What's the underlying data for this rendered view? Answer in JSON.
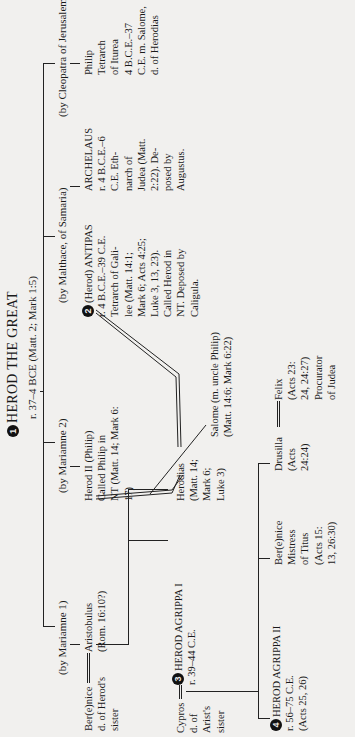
{
  "root": {
    "number": "1",
    "name": "HEROD THE GREAT",
    "reign": "r. 37–4 BCE (Matt. 2; Mark 1:5)"
  },
  "wives": [
    {
      "label": "(by Mariamne 1)"
    },
    {
      "label": "(by Mariamne 2)"
    },
    {
      "label": "(by Malthace, of Samaria)"
    },
    {
      "label": "(by Cleopatra of Jerusalem)"
    }
  ],
  "people": {
    "berenice_sister": {
      "lines": [
        "Ber(e)nice",
        "d. of Herod's",
        "sister"
      ]
    },
    "aristobulus": {
      "lines": [
        "Aristobulus",
        "(Rom. 16:10?)"
      ]
    },
    "herod_ii": {
      "lines": [
        "Herod II (Philip)",
        "Called Philip in",
        "NT (Matt. 14; Mark 6:",
        "17)"
      ]
    },
    "antipas": {
      "number": "2",
      "lines": [
        "(Herod) ANTIPAS",
        "r. 4 B.C.E.–39 C.E.",
        "Tetrarch of Gali-",
        "lee (Matt. 14:1;",
        "Mark 6; Acts 4:25;",
        "Luke 3, 13, 23).",
        "Called Herod in",
        "NT. Deposed by",
        "Caligula."
      ]
    },
    "archelaus": {
      "lines": [
        "ARCHELAUS",
        "r. 4 B.C.E.–6",
        "C.E. Eth-",
        "narch of",
        "Judea (Matt.",
        "2:22). De-",
        "posed by",
        "Augustus."
      ]
    },
    "philip": {
      "lines": [
        "Philip",
        "Tetrarch",
        "of Iturea",
        "4 B.C.E.–37",
        "C.E. m. Salome,",
        "d. of Herodias"
      ]
    },
    "cypros": {
      "lines": [
        "Cypros",
        "d. of",
        "Arist's",
        "sister"
      ]
    },
    "agrippa_i": {
      "number": "3",
      "lines": [
        "HEROD AGRIPPA I",
        "r. 39–44 C.E."
      ]
    },
    "herodias": {
      "lines": [
        "Herodias",
        "(Matt. 14;",
        "Mark 6;",
        "Luke 3)"
      ]
    },
    "salome": {
      "lines": [
        "Salome (m. uncle Philip)",
        "(Matt. 14:6; Mark 6:22)"
      ]
    },
    "agrippa_ii": {
      "number": "4",
      "lines": [
        "HEROD AGRIPPA II",
        "r. 56–75 C.E.",
        "(Acts 25, 26)"
      ]
    },
    "berenice": {
      "lines": [
        "Ber(e)nice",
        "Mistress",
        "of Titus",
        "(Acts 15:",
        "13, 26:30)"
      ]
    },
    "drusilla": {
      "lines": [
        "Drusilla",
        "(Acts",
        "24:24)"
      ]
    },
    "felix": {
      "lines": [
        "Felix",
        "(Acts 23:",
        "24, 24:27)",
        "Procurator",
        "of Judea"
      ]
    }
  }
}
